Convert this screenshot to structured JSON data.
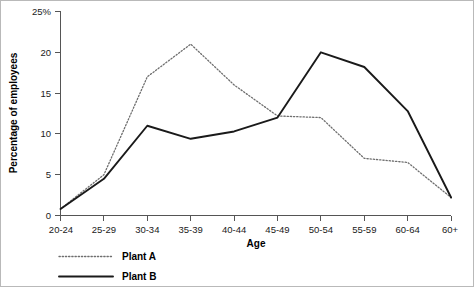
{
  "chart_data": {
    "type": "line",
    "title": "",
    "xlabel": "Age",
    "ylabel": "Percentage of employees",
    "categories": [
      "20-24",
      "25-29",
      "30-34",
      "35-39",
      "40-44",
      "45-49",
      "50-54",
      "55-59",
      "60-64",
      "60+"
    ],
    "series": [
      {
        "name": "Plant A",
        "style": "dotted",
        "color": "#6e6e6e",
        "values": [
          0.8,
          5.0,
          17.0,
          21.0,
          16.0,
          12.2,
          12.0,
          7.0,
          6.5,
          2.2
        ]
      },
      {
        "name": "Plant B",
        "style": "solid",
        "color": "#1a1a1a",
        "values": [
          0.8,
          4.5,
          11.0,
          9.4,
          10.3,
          12.0,
          20.0,
          18.2,
          12.8,
          2.2
        ]
      }
    ],
    "ylim": [
      0,
      25
    ],
    "yticks": [
      0,
      5,
      10,
      15,
      20,
      25
    ],
    "ytick_labels": [
      "0",
      "5",
      "10",
      "15",
      "20",
      "25%"
    ],
    "grid": false,
    "legend_position": "bottom-left"
  },
  "legend": {
    "entries": [
      {
        "label": "Plant A"
      },
      {
        "label": "Plant B"
      }
    ]
  }
}
